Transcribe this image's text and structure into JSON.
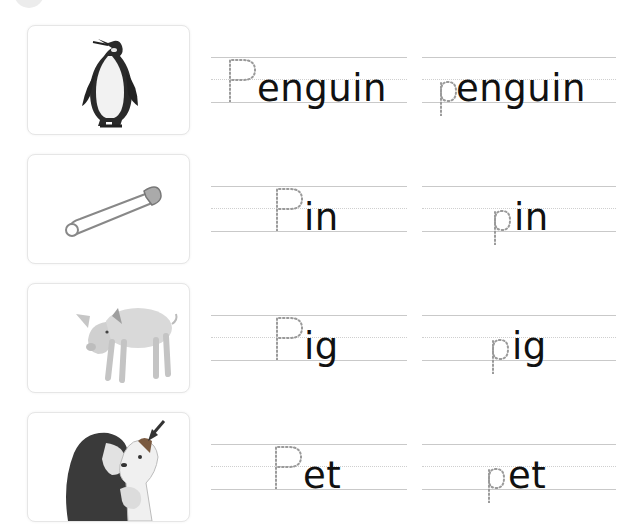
{
  "worksheet": {
    "rows": [
      {
        "picture": "penguin",
        "uppercase": {
          "traced_letter": "P",
          "rest": "enguin"
        },
        "lowercase": {
          "traced_letter": "p",
          "rest": "enguin"
        }
      },
      {
        "picture": "safety pin",
        "uppercase": {
          "traced_letter": "P",
          "rest": "in"
        },
        "lowercase": {
          "traced_letter": "p",
          "rest": "in"
        }
      },
      {
        "picture": "pig",
        "uppercase": {
          "traced_letter": "P",
          "rest": "ig"
        },
        "lowercase": {
          "traced_letter": "p",
          "rest": "ig"
        }
      },
      {
        "picture": "pet (girl kissing a dog, arrow pointing to dog)",
        "uppercase": {
          "traced_letter": "P",
          "rest": "et"
        },
        "lowercase": {
          "traced_letter": "p",
          "rest": "et"
        }
      }
    ]
  },
  "colors": {
    "ink": "#111111",
    "trace_dots": "#9a9a9a",
    "rule_line": "#c9c9c9",
    "card_border": "#e6e6e6"
  }
}
